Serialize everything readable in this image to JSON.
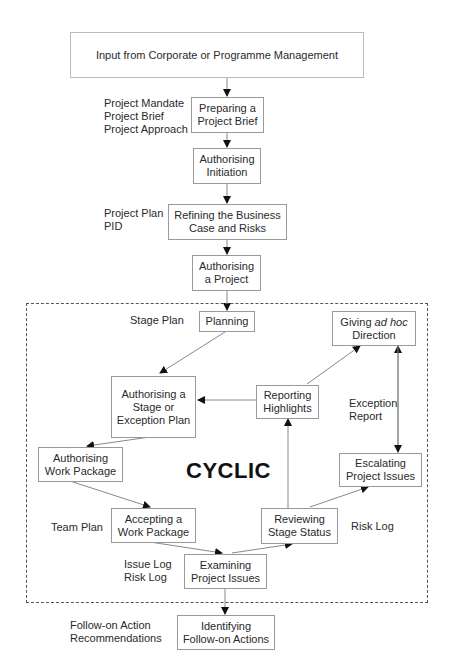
{
  "diagram": {
    "type": "process-flow",
    "top_input": "Input from Corporate or Programme Management",
    "processes": [
      {
        "id": "preparing",
        "lines": [
          "Preparing a",
          "Project Brief"
        ]
      },
      {
        "id": "auth_init",
        "lines": [
          "Authorising",
          "Initiation"
        ]
      },
      {
        "id": "refining",
        "lines": [
          "Refining the Business",
          "Case and Risks"
        ]
      },
      {
        "id": "auth_project",
        "lines": [
          "Authorising",
          "a Project"
        ]
      },
      {
        "id": "planning",
        "lines": [
          "Planning"
        ]
      },
      {
        "id": "giving",
        "lines": [
          "Giving ",
          "ad hoc",
          "Direction"
        ]
      },
      {
        "id": "auth_stage",
        "lines": [
          "Authorising a",
          "Stage or",
          "Exception Plan"
        ]
      },
      {
        "id": "reporting",
        "lines": [
          "Reporting",
          "Highlights"
        ]
      },
      {
        "id": "auth_wp",
        "lines": [
          "Authorising",
          "Work Package"
        ]
      },
      {
        "id": "escalating",
        "lines": [
          "Escalating",
          "Project Issues"
        ]
      },
      {
        "id": "accepting",
        "lines": [
          "Accepting a",
          "Work Package"
        ]
      },
      {
        "id": "reviewing",
        "lines": [
          "Reviewing",
          "Stage Status"
        ]
      },
      {
        "id": "examining",
        "lines": [
          "Examining",
          "Project Issues"
        ]
      },
      {
        "id": "identifying",
        "lines": [
          "Identifying",
          "Follow-on Actions"
        ]
      }
    ],
    "annotations": {
      "brief_products": [
        "Project Mandate",
        "Project Brief",
        "Project Approach"
      ],
      "refining_products": [
        "Project Plan",
        "PID"
      ],
      "stage_plan": "Stage Plan",
      "exception_report": [
        "Exception",
        "Report"
      ],
      "team_plan": "Team Plan",
      "risk_log_right": "Risk Log",
      "issue_logs": [
        "Issue Log",
        "Risk Log"
      ],
      "follow_on": [
        "Follow-on Action",
        "Recommendations"
      ]
    },
    "cyclic_region_label": "CYCLIC"
  }
}
